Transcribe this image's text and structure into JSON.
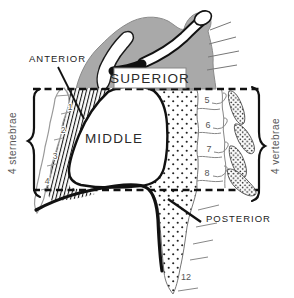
{
  "diagram": {
    "title_region_labels": {
      "superior": "SUPERIOR",
      "anterior": "ANTERIOR",
      "middle": "MIDDLE",
      "posterior": "POSTERIOR"
    },
    "side_labels": {
      "left": "4 sternebrae",
      "right": "4 vertebrae"
    },
    "sternebrae": [
      "1",
      "2",
      "3",
      "4"
    ],
    "vertebrae": [
      "5",
      "6",
      "7",
      "8"
    ],
    "lowest_vertebra": "12",
    "colors": {
      "superior_fill": "#a9a9a9",
      "outline": "#151515",
      "bone_outline": "#949494",
      "number_text": "#555555",
      "label_text": "#222222"
    }
  }
}
